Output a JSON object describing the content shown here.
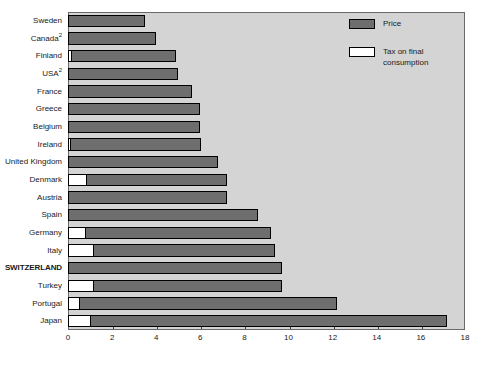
{
  "chart_data": {
    "type": "bar",
    "orientation": "horizontal",
    "stacked": true,
    "title": "",
    "subtitle": "",
    "xlabel": "",
    "ylabel": "",
    "xlim": [
      0,
      18
    ],
    "xticks": [
      0,
      2,
      4,
      6,
      8,
      10,
      12,
      14,
      16,
      18
    ],
    "xtick_labels": [
      "0",
      "2",
      "4",
      "6",
      "8",
      "10",
      "12",
      "14",
      "16",
      "18"
    ],
    "grid": false,
    "legend_position": "top-right",
    "categories": [
      "Sweden",
      "Canada²",
      "Finland",
      "USA²",
      "France",
      "Greece",
      "Belgium",
      "Ireland",
      "United Kingdom",
      "Denmark",
      "Austria",
      "Spain",
      "Germany",
      "Italy",
      "SWITZERLAND",
      "Turkey",
      "Portugal",
      "Japan"
    ],
    "series": [
      {
        "name": "Tax on final consumption",
        "color": "#ffffff",
        "values": [
          0.0,
          0.0,
          0.15,
          0.0,
          0.0,
          0.0,
          0.0,
          0.08,
          0.0,
          0.8,
          0.0,
          0.0,
          0.75,
          1.15,
          0.0,
          1.15,
          0.5,
          1.0
        ]
      },
      {
        "name": "Price",
        "color": "#6e6e6e",
        "values": [
          3.5,
          4.0,
          4.75,
          5.0,
          5.6,
          6.0,
          6.0,
          5.95,
          6.8,
          6.4,
          7.2,
          8.6,
          8.45,
          8.25,
          9.7,
          8.55,
          11.7,
          16.2
        ]
      }
    ],
    "totals": [
      3.5,
      4.0,
      4.9,
      5.0,
      5.6,
      6.0,
      6.0,
      6.03,
      6.8,
      7.2,
      7.2,
      8.6,
      9.2,
      9.4,
      9.7,
      9.7,
      12.2,
      17.2
    ]
  },
  "legend": {
    "items": [
      {
        "label": "Price",
        "swatch": "price-swatch"
      },
      {
        "label": "Tax on final\nconsumption",
        "swatch": "tax-swatch"
      }
    ]
  },
  "colors": {
    "plot_background": "#d4d4d4",
    "price_fill": "#6e6e6e",
    "tax_fill": "#ffffff",
    "bar_outline": "#000000",
    "axis": "#6a6a6a",
    "text": "#1a1a1a",
    "page_background": "#ffffff"
  },
  "rows": [
    {
      "label": "Sweden",
      "sup": "",
      "bold": false,
      "tax": 0.0,
      "total": 3.5
    },
    {
      "label": "Canada",
      "sup": "2",
      "bold": false,
      "tax": 0.0,
      "total": 4.0
    },
    {
      "label": "Finland",
      "sup": "",
      "bold": false,
      "tax": 0.15,
      "total": 4.9
    },
    {
      "label": "USA",
      "sup": "2",
      "bold": false,
      "tax": 0.0,
      "total": 5.0
    },
    {
      "label": "France",
      "sup": "",
      "bold": false,
      "tax": 0.0,
      "total": 5.6
    },
    {
      "label": "Greece",
      "sup": "",
      "bold": false,
      "tax": 0.0,
      "total": 6.0
    },
    {
      "label": "Belgium",
      "sup": "",
      "bold": false,
      "tax": 0.0,
      "total": 6.0
    },
    {
      "label": "Ireland",
      "sup": "",
      "bold": false,
      "tax": 0.08,
      "total": 6.03
    },
    {
      "label": "United Kingdom",
      "sup": "",
      "bold": false,
      "tax": 0.0,
      "total": 6.8
    },
    {
      "label": "Denmark",
      "sup": "",
      "bold": false,
      "tax": 0.8,
      "total": 7.2
    },
    {
      "label": "Austria",
      "sup": "",
      "bold": false,
      "tax": 0.0,
      "total": 7.2
    },
    {
      "label": "Spain",
      "sup": "",
      "bold": false,
      "tax": 0.0,
      "total": 8.6
    },
    {
      "label": "Germany",
      "sup": "",
      "bold": false,
      "tax": 0.75,
      "total": 9.2
    },
    {
      "label": "Italy",
      "sup": "",
      "bold": false,
      "tax": 1.15,
      "total": 9.4
    },
    {
      "label": "SWITZERLAND",
      "sup": "",
      "bold": true,
      "tax": 0.0,
      "total": 9.7
    },
    {
      "label": "Turkey",
      "sup": "",
      "bold": false,
      "tax": 1.15,
      "total": 9.7
    },
    {
      "label": "Portugal",
      "sup": "",
      "bold": false,
      "tax": 0.5,
      "total": 12.2
    },
    {
      "label": "Japan",
      "sup": "",
      "bold": false,
      "tax": 1.0,
      "total": 17.2
    }
  ]
}
